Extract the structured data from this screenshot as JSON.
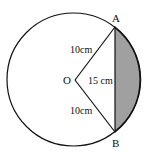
{
  "diagram": {
    "points": {
      "A": "A",
      "B": "B",
      "O": "O"
    },
    "labels": {
      "OA": "10cm",
      "OB": "10cm",
      "AB": "15 cm"
    },
    "colors": {
      "shade": "#9e9e9e",
      "stroke": "#111111"
    }
  }
}
